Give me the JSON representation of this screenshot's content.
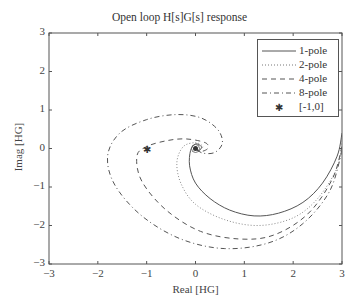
{
  "chart_data": {
    "type": "line",
    "title": "Open loop H[s]G[s] response",
    "xlabel": "Real [HG]",
    "ylabel": "Imag [HG]",
    "xlim": [
      -3,
      3
    ],
    "ylim": [
      -3,
      3
    ],
    "xticks": [
      "-3",
      "-2",
      "-1",
      "0",
      "1",
      "2",
      "3"
    ],
    "yticks": [
      "3",
      "2",
      "1",
      "0",
      "-1",
      "-2",
      "-3"
    ],
    "grid": false,
    "legend_position": "upper right",
    "legend": [
      "1-pole",
      "2-pole",
      "4-pole",
      "8-pole",
      "[-1,0]"
    ],
    "series": [
      {
        "name": "1-pole",
        "style": "solid",
        "points": [
          [
            3.0,
            0.4
          ],
          [
            2.9,
            -0.2
          ],
          [
            2.6,
            -0.9
          ],
          [
            2.2,
            -1.4
          ],
          [
            1.7,
            -1.68
          ],
          [
            1.2,
            -1.75
          ],
          [
            0.7,
            -1.6
          ],
          [
            0.3,
            -1.3
          ],
          [
            0.0,
            -0.9
          ],
          [
            -0.12,
            -0.45
          ],
          [
            -0.1,
            -0.05
          ],
          [
            0.0,
            0.12
          ],
          [
            0.12,
            0.05
          ],
          [
            0.08,
            -0.05
          ],
          [
            0.0,
            0.0
          ]
        ]
      },
      {
        "name": "2-pole",
        "style": "dotted",
        "points": [
          [
            3.0,
            0.2
          ],
          [
            2.9,
            -0.5
          ],
          [
            2.5,
            -1.3
          ],
          [
            2.0,
            -1.8
          ],
          [
            1.3,
            -2.0
          ],
          [
            0.6,
            -1.85
          ],
          [
            0.0,
            -1.45
          ],
          [
            -0.3,
            -0.9
          ],
          [
            -0.38,
            -0.35
          ],
          [
            -0.25,
            0.05
          ],
          [
            0.0,
            0.15
          ],
          [
            0.15,
            0.05
          ],
          [
            0.05,
            -0.05
          ],
          [
            0.0,
            0.0
          ]
        ]
      },
      {
        "name": "4-pole",
        "style": "dashed",
        "points": [
          [
            3.0,
            0.05
          ],
          [
            2.8,
            -0.8
          ],
          [
            2.3,
            -1.7
          ],
          [
            1.6,
            -2.25
          ],
          [
            0.9,
            -2.35
          ],
          [
            0.1,
            -2.15
          ],
          [
            -0.6,
            -1.6
          ],
          [
            -1.1,
            -0.85
          ],
          [
            -1.2,
            -0.2
          ],
          [
            -1.0,
            0.05
          ],
          [
            -0.6,
            0.2
          ],
          [
            -0.2,
            0.25
          ],
          [
            0.2,
            0.15
          ],
          [
            0.25,
            0.0
          ],
          [
            0.1,
            -0.08
          ],
          [
            0.0,
            0.0
          ]
        ]
      },
      {
        "name": "8-pole",
        "style": "dashdot",
        "points": [
          [
            3.0,
            -0.05
          ],
          [
            2.75,
            -1.1
          ],
          [
            2.2,
            -1.95
          ],
          [
            1.5,
            -2.45
          ],
          [
            0.6,
            -2.6
          ],
          [
            -0.3,
            -2.35
          ],
          [
            -1.1,
            -1.75
          ],
          [
            -1.65,
            -0.95
          ],
          [
            -1.8,
            -0.2
          ],
          [
            -1.55,
            0.4
          ],
          [
            -1.0,
            0.75
          ],
          [
            -0.4,
            0.88
          ],
          [
            0.1,
            0.8
          ],
          [
            0.45,
            0.5
          ],
          [
            0.55,
            0.15
          ],
          [
            0.4,
            -0.1
          ],
          [
            0.15,
            -0.12
          ],
          [
            0.0,
            0.0
          ]
        ]
      }
    ],
    "markers": [
      {
        "name": "[-1,0]",
        "x": -1,
        "y": 0,
        "symbol": "asterisk"
      }
    ]
  },
  "colors": {
    "line": "#555555",
    "axis": "#555555",
    "text": "#333333",
    "background": "#ffffff"
  }
}
